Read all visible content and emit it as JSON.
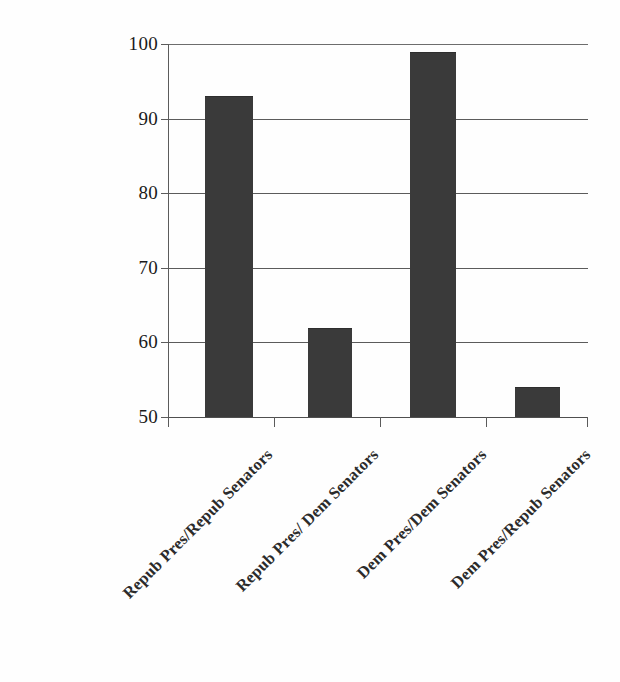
{
  "chart_data": {
    "type": "bar",
    "title": "",
    "subtitle": "",
    "xlabel": "",
    "ylabel": "",
    "categories": [
      "Repub Pres/Repub Senators",
      "Repub Pres/ Dem Senators",
      "Dem Pres/Dem Senators",
      "Dem Pres/Repub Senators"
    ],
    "values": [
      93,
      62,
      99,
      54
    ],
    "ylim": [
      50,
      100
    ],
    "yticks": [
      50,
      60,
      70,
      80,
      90,
      100
    ],
    "ytick_labels": [
      "50",
      "60",
      "70",
      "80",
      "90",
      "100"
    ],
    "grid": true,
    "grid_axis": "y",
    "legend": false,
    "legend_position": "none",
    "bar_color": "#3a3a3a",
    "gridline_color": "#5b5b5b",
    "axis_color": "#4f4f4f",
    "background_color": "#fefefe",
    "data_labels": false,
    "annotations": []
  }
}
